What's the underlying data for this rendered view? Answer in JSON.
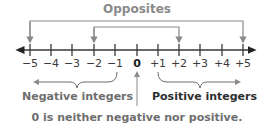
{
  "title": "Opposites",
  "number_line": {
    "ticks": [
      {
        "label": "−5",
        "x": 30
      },
      {
        "label": "−4",
        "x": 51
      },
      {
        "label": "−3",
        "x": 72
      },
      {
        "label": "−2",
        "x": 94
      },
      {
        "label": "−1",
        "x": 115
      },
      {
        "label": "0",
        "x": 137
      },
      {
        "label": "+1",
        "x": 158
      },
      {
        "label": "+2",
        "x": 179
      },
      {
        "label": "+3",
        "x": 200
      },
      {
        "label": "+4",
        "x": 222
      },
      {
        "label": "+5",
        "x": 243
      }
    ],
    "opposite_pairs": [
      {
        "from": "−5",
        "to": "+5"
      },
      {
        "from": "−2",
        "to": "+2"
      }
    ]
  },
  "labels": {
    "negative": "Negative integers",
    "positive": "Positive integers",
    "zero_note": "0 is neither negative nor positive."
  },
  "colors": {
    "line": "#3a3a3a",
    "bracket": "#8a8a8a",
    "title": "#8a8a8a",
    "text_dark": "#2e2e2e",
    "text_gray": "#6e6e6e"
  }
}
